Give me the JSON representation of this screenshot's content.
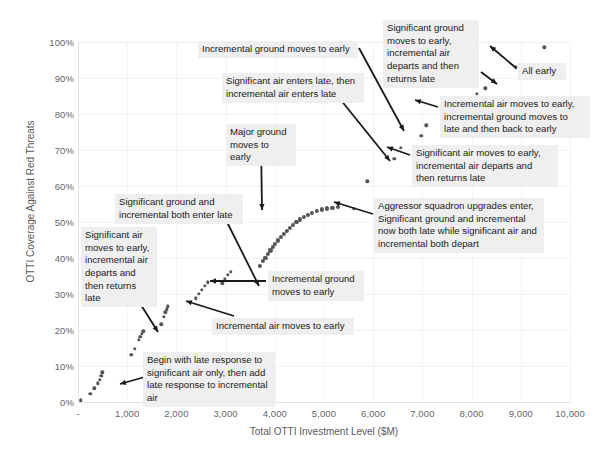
{
  "chart_data": {
    "type": "scatter",
    "title": "",
    "xlabel": "Total OTTI Investment Level ($M)",
    "ylabel": "OTTI Coverage Against Red Threats",
    "xlim": [
      0,
      10000
    ],
    "ylim": [
      0,
      1.0
    ],
    "grid": true,
    "legend": "none",
    "xticks": [
      "-",
      "1,000",
      "2,000",
      "3,000",
      "4,000",
      "5,000",
      "6,000",
      "7,000",
      "8,000",
      "9,000",
      "10,000"
    ],
    "xtick_values": [
      0,
      1000,
      2000,
      3000,
      4000,
      5000,
      6000,
      7000,
      8000,
      9000,
      10000
    ],
    "yticks": [
      "0%",
      "10%",
      "20%",
      "30%",
      "40%",
      "50%",
      "60%",
      "70%",
      "80%",
      "90%",
      "100%"
    ],
    "ytick_values": [
      0,
      0.1,
      0.2,
      0.3,
      0.4,
      0.5,
      0.6,
      0.7,
      0.8,
      0.9,
      1.0
    ],
    "point_color": "#555555",
    "grid_color": "#f2f2f2",
    "points": [
      [
        60,
        0.005
      ],
      [
        250,
        0.022
      ],
      [
        330,
        0.038
      ],
      [
        400,
        0.052
      ],
      [
        440,
        0.062
      ],
      [
        470,
        0.072
      ],
      [
        495,
        0.083
      ],
      [
        1080,
        0.131
      ],
      [
        1160,
        0.147
      ],
      [
        1235,
        0.172
      ],
      [
        1270,
        0.181
      ],
      [
        1300,
        0.19
      ],
      [
        1330,
        0.196
      ],
      [
        1690,
        0.216
      ],
      [
        1745,
        0.236
      ],
      [
        1775,
        0.249
      ],
      [
        1800,
        0.257
      ],
      [
        1830,
        0.266
      ],
      [
        2400,
        0.288
      ],
      [
        2460,
        0.3
      ],
      [
        2520,
        0.312
      ],
      [
        2580,
        0.322
      ],
      [
        2640,
        0.333
      ],
      [
        2930,
        0.33
      ],
      [
        2990,
        0.342
      ],
      [
        3045,
        0.353
      ],
      [
        3100,
        0.362
      ],
      [
        3690,
        0.377
      ],
      [
        3760,
        0.391
      ],
      [
        3810,
        0.401
      ],
      [
        3860,
        0.411
      ],
      [
        3910,
        0.421
      ],
      [
        3960,
        0.431
      ],
      [
        4010,
        0.44
      ],
      [
        4060,
        0.449
      ],
      [
        4120,
        0.458
      ],
      [
        4180,
        0.467
      ],
      [
        4240,
        0.476
      ],
      [
        4300,
        0.484
      ],
      [
        4370,
        0.492
      ],
      [
        4440,
        0.5
      ],
      [
        4510,
        0.507
      ],
      [
        4590,
        0.514
      ],
      [
        4670,
        0.52
      ],
      [
        4760,
        0.526
      ],
      [
        4850,
        0.531
      ],
      [
        4950,
        0.535
      ],
      [
        5060,
        0.538
      ],
      [
        5170,
        0.54
      ],
      [
        5290,
        0.541
      ],
      [
        5600,
        0.537
      ],
      [
        5880,
        0.613
      ],
      [
        6430,
        0.675
      ],
      [
        6560,
        0.706
      ],
      [
        6980,
        0.739
      ],
      [
        7080,
        0.769
      ],
      [
        7400,
        0.8
      ],
      [
        7720,
        0.826
      ],
      [
        8100,
        0.856
      ],
      [
        8280,
        0.871
      ],
      [
        8900,
        0.93
      ],
      [
        9480,
        0.985
      ]
    ],
    "dense_arc_note": "Cluster of closely-spaced markers forming the rising arc between 3,700 and 5,300"
  },
  "annotations": [
    {
      "id": "incremental-ground-early-top",
      "text": "Incremental ground moves to early",
      "left": 198,
      "top": 41,
      "width": 160
    },
    {
      "id": "significant-air-enters-late",
      "text": "Significant air enters late, then\nincremental air enters late",
      "left": 222,
      "top": 73,
      "width": 142
    },
    {
      "id": "significant-ground-early-air-departs",
      "text": "Significant ground\nmoves to early,\nincremental air\ndeparts and then\nreturns late",
      "left": 383,
      "top": 20,
      "width": 96
    },
    {
      "id": "all-early",
      "text": "All early",
      "left": 518,
      "top": 63,
      "width": 48
    },
    {
      "id": "incremental-air-early-ground-late",
      "text": "Incremental air moves to early,\nincremental ground moves to\nlate and then back to early",
      "left": 440,
      "top": 96,
      "width": 150
    },
    {
      "id": "significant-air-early-air-departs",
      "text": "Significant air moves to early,\nincremental air departs and\nthen returns late",
      "left": 412,
      "top": 145,
      "width": 146
    },
    {
      "id": "aggressor-squadron-upgrades",
      "text": "Aggressor squadron upgrades enter,\nSignificant ground and incremental\nnow both late while significant air and\nincremental both depart",
      "left": 374,
      "top": 198,
      "width": 170
    },
    {
      "id": "major-ground-early",
      "text": "Major ground\nmoves to early",
      "left": 226,
      "top": 124,
      "width": 70
    },
    {
      "id": "significant-ground-incremental-late",
      "text": "Significant ground and\nincremental both enter late",
      "left": 115,
      "top": 194,
      "width": 128
    },
    {
      "id": "significant-air-early-departs-returns",
      "text": "Significant air\nmoves to early,\nincremental air\ndeparts and\nthen returns\nlate",
      "left": 81,
      "top": 227,
      "width": 76
    },
    {
      "id": "incremental-ground-early-mid",
      "text": "Incremental ground\nmoves to early",
      "left": 268,
      "top": 271,
      "width": 96
    },
    {
      "id": "incremental-air-early",
      "text": "Incremental air moves to early",
      "left": 212,
      "top": 318,
      "width": 142
    },
    {
      "id": "begin-with-late-response",
      "text": "Begin with late response to\nsignificant air only, then add\nlate response to incremental\nair",
      "left": 143,
      "top": 352,
      "width": 132
    }
  ],
  "leaders": [
    {
      "id": "leader-incremental-ground-early-top",
      "x1": 359,
      "y1": 48,
      "x2": 404,
      "y2": 131
    },
    {
      "id": "leader-significant-air-enters-late",
      "x1": 336,
      "y1": 94,
      "x2": 390,
      "y2": 161
    },
    {
      "id": "leader-significant-ground-early-air-departs",
      "x1": 481,
      "y1": 72,
      "x2": 497,
      "y2": 84
    },
    {
      "id": "leader-all-early",
      "x1": 516,
      "y1": 68,
      "x2": 490,
      "y2": 46
    },
    {
      "id": "leader-incremental-air-early-ground-late",
      "x1": 438,
      "y1": 107,
      "x2": 415,
      "y2": 100
    },
    {
      "id": "leader-significant-air-early-departs2",
      "x1": 410,
      "y1": 155,
      "x2": 387,
      "y2": 147
    },
    {
      "id": "leader-aggressor",
      "x1": 373,
      "y1": 214,
      "x2": 334,
      "y2": 202
    },
    {
      "id": "leader-major-ground-early",
      "x1": 261,
      "y1": 141,
      "x2": 262,
      "y2": 210
    },
    {
      "id": "leader-significant-ground-incremental-late",
      "x1": 222,
      "y1": 212,
      "x2": 259,
      "y2": 286
    },
    {
      "id": "leader-significant-air-early-departs-returns",
      "x1": 136,
      "y1": 297,
      "x2": 158,
      "y2": 332
    },
    {
      "id": "leader-incremental-ground-early-mid",
      "x1": 266,
      "y1": 281,
      "x2": 210,
      "y2": 281
    },
    {
      "id": "leader-incremental-air-early",
      "x1": 234,
      "y1": 316,
      "x2": 186,
      "y2": 301
    },
    {
      "id": "leader-begin-with-late-response",
      "x1": 180,
      "y1": 367,
      "x2": 120,
      "y2": 384
    }
  ]
}
